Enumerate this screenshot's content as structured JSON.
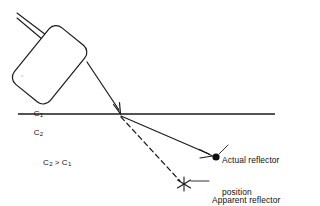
{
  "figure": {
    "background_color": "#ffffff",
    "stroke_color": "#1a1a1a",
    "text_color": "#101010",
    "width": 320,
    "height": 206
  },
  "labels": {
    "medium_upper": "C",
    "medium_upper_sub": "1",
    "medium_lower": "C",
    "medium_lower_sub": "2",
    "condition_left": "C",
    "condition_left_sub": "2",
    "condition_operator": ">",
    "condition_right": "C",
    "condition_right_sub": "1",
    "actual_reflector_line1": "Actual reflector",
    "actual_reflector_line2": "position",
    "apparent_reflector_line1": "Apparent reflector",
    "apparent_reflector_line2": "position"
  },
  "elements": {
    "transducer": "transducer-body",
    "cable_upper": "transducer-cable-upper",
    "cable_lower": "transducer-cable-lower",
    "incident_ray": "incident-beam-arrow",
    "interface": "media-interface-line",
    "refracted_ray": "refracted-beam-arrow",
    "straight_line_path": "assumed-straight-path-dashed",
    "actual_marker": "actual-reflector-dot",
    "apparent_marker": "apparent-reflector-asterisk",
    "actual_leader": "actual-reflector-leader-line",
    "apparent_leader": "apparent-reflector-leader-line"
  },
  "geometry": {
    "interface_y": 114,
    "interface_x_start": 18,
    "interface_x_end": 275,
    "refraction_point_x": 120,
    "refraction_point_y": 114,
    "actual_reflector_x": 215,
    "actual_reflector_y": 157,
    "apparent_reflector_x": 184,
    "apparent_reflector_y": 184,
    "incident_start_x": 87,
    "incident_start_y": 62
  }
}
